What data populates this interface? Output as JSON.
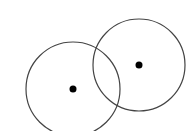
{
  "diagram": {
    "background": "#ffffff",
    "stroke_color": "#444444",
    "dot_color": "#000000",
    "circles": [
      {
        "name": "left-circle",
        "cx": 73,
        "cy": 89,
        "r": 47,
        "dot_r": 3.5
      },
      {
        "name": "right-circle",
        "cx": 139,
        "cy": 65,
        "r": 46,
        "dot_r": 3.5
      }
    ]
  }
}
